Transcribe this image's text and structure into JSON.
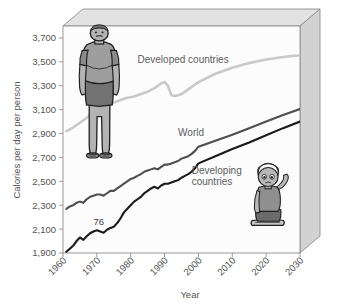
{
  "chart_data": {
    "type": "line",
    "title": "",
    "xlabel": "Year",
    "ylabel": "Calories per day per person",
    "xlim": [
      1960,
      2030
    ],
    "ylim": [
      1900,
      3800
    ],
    "yticks": [
      "1,900",
      "2,100",
      "2,300",
      "2,500",
      "2,700",
      "2,900",
      "3,100",
      "3,300",
      "3,500",
      "3,700"
    ],
    "ytick_values": [
      1900,
      2100,
      2300,
      2500,
      2700,
      2900,
      3100,
      3300,
      3500,
      3700
    ],
    "xticks": [
      "1960",
      "1970",
      "1980",
      "1990",
      "2000",
      "2010",
      "2020",
      "2030"
    ],
    "xtick_values": [
      1960,
      1970,
      1980,
      1990,
      2000,
      2010,
      2020,
      2030
    ],
    "grid": false,
    "legend_position": "inline-annotations",
    "series": [
      {
        "name": "Developed countries",
        "color": "#c9c9c9",
        "label_x": 1982,
        "label_y": 3490,
        "x": [
          1961,
          1963,
          1965,
          1967,
          1969,
          1971,
          1973,
          1975,
          1977,
          1979,
          1981,
          1983,
          1985,
          1987,
          1989,
          1990,
          1991,
          1992,
          1993,
          1994,
          1995,
          1997,
          2000,
          2005,
          2010,
          2015,
          2020,
          2025,
          2030
        ],
        "y": [
          2920,
          2950,
          2990,
          3030,
          3080,
          3120,
          3150,
          3160,
          3180,
          3200,
          3210,
          3230,
          3250,
          3280,
          3320,
          3330,
          3300,
          3220,
          3215,
          3220,
          3230,
          3270,
          3330,
          3400,
          3450,
          3490,
          3520,
          3540,
          3555
        ]
      },
      {
        "name": "World",
        "color": "#4f4f4f",
        "label_x": 1994,
        "label_y": 2880,
        "x": [
          1961,
          1962,
          1963,
          1964,
          1965,
          1966,
          1967,
          1968,
          1969,
          1970,
          1971,
          1972,
          1973,
          1974,
          1975,
          1976,
          1977,
          1978,
          1979,
          1980,
          1981,
          1982,
          1983,
          1984,
          1985,
          1986,
          1987,
          1988,
          1989,
          1990,
          1991,
          1992,
          1993,
          1994,
          1995,
          1996,
          1997,
          1998,
          1999,
          2000,
          2005,
          2010,
          2015,
          2020,
          2025,
          2030
        ],
        "y": [
          2270,
          2290,
          2300,
          2320,
          2330,
          2320,
          2350,
          2370,
          2380,
          2390,
          2390,
          2380,
          2400,
          2420,
          2420,
          2440,
          2460,
          2480,
          2500,
          2520,
          2530,
          2545,
          2560,
          2580,
          2590,
          2600,
          2610,
          2600,
          2620,
          2640,
          2640,
          2650,
          2660,
          2670,
          2690,
          2700,
          2710,
          2730,
          2755,
          2790,
          2840,
          2890,
          2945,
          3000,
          3055,
          3105
        ]
      },
      {
        "name": "Developing countries",
        "color": "#1a1a1a",
        "label_x": 1998,
        "label_y": 2560,
        "x": [
          1961,
          1962,
          1963,
          1964,
          1965,
          1966,
          1967,
          1968,
          1969,
          1970,
          1971,
          1972,
          1973,
          1974,
          1975,
          1976,
          1977,
          1978,
          1979,
          1980,
          1981,
          1982,
          1983,
          1984,
          1985,
          1986,
          1987,
          1988,
          1989,
          1990,
          1991,
          1992,
          1993,
          1994,
          1995,
          1996,
          1997,
          1998,
          1999,
          2000,
          2005,
          2010,
          2015,
          2020,
          2025,
          2030
        ],
        "y": [
          1910,
          1935,
          1960,
          2000,
          2030,
          2010,
          2040,
          2065,
          2080,
          2090,
          2080,
          2070,
          2095,
          2110,
          2120,
          2150,
          2190,
          2240,
          2270,
          2300,
          2330,
          2350,
          2370,
          2400,
          2420,
          2440,
          2455,
          2440,
          2465,
          2480,
          2480,
          2490,
          2500,
          2510,
          2530,
          2545,
          2560,
          2580,
          2610,
          2650,
          2710,
          2770,
          2825,
          2885,
          2945,
          3000
        ]
      }
    ],
    "annotations": [
      {
        "text": "76",
        "x": 1969,
        "y": 2135,
        "name": "data-annotation-76"
      }
    ]
  },
  "illustrations": [
    {
      "name": "obese-man-illustration",
      "alt": "obese man standing"
    },
    {
      "name": "malnourished-child-illustration",
      "alt": "malnourished child sitting"
    }
  ],
  "colors": {
    "developed": "#c9c9c9",
    "world": "#4f4f4f",
    "developing": "#1a1a1a",
    "frame": "#8a8a8a",
    "frame_face": "#d8d8d8",
    "plot_bg": "#fbfbfb",
    "text": "#545454"
  }
}
